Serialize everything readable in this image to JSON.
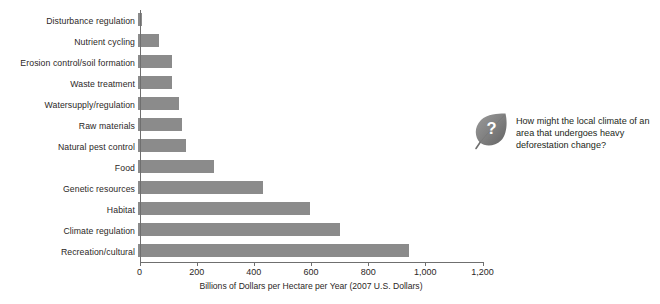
{
  "chart_data": {
    "type": "bar",
    "orientation": "horizontal",
    "title": "",
    "xlabel": "Billions of Dollars per Hectare per Year (2007 U.S. Dollars)",
    "ylabel": "",
    "xlim": [
      0,
      1200
    ],
    "xticks": [
      0,
      200,
      400,
      600,
      800,
      1000,
      1200
    ],
    "xticklabels": [
      "0",
      "200",
      "400",
      "600",
      "800",
      "1,000",
      "1,200"
    ],
    "grid": false,
    "legend": null,
    "bar_color": "#8b8b8b",
    "axis_color": "#6f6f6f",
    "categories": [
      "Disturbance regulation",
      "Nutrient cycling",
      "Erosion control/soil formation",
      "Waste treatment",
      "Watersupply/regulation",
      "Raw materials",
      "Natural pest control",
      "Food",
      "Genetic resources",
      "Habitat",
      "Climate regulation",
      "Recreation/cultural"
    ],
    "values": [
      14,
      75,
      120,
      120,
      145,
      155,
      170,
      265,
      440,
      605,
      710,
      950
    ]
  },
  "callout": {
    "icon": "leaf-question-icon",
    "icon_glyph": "?",
    "question": "How might the local climate of an area that undergoes heavy deforestation change?"
  }
}
